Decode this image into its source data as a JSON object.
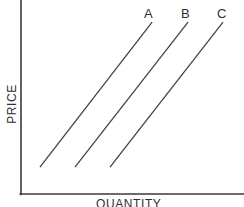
{
  "figure": {
    "name": "supply-curve-shift-diagram",
    "background_color": "#ffffff",
    "width": 244,
    "height": 207
  },
  "axes": {
    "y_axis_label": "PRICE",
    "x_axis_label": "QUANTITY",
    "axis_color": "#3a3a3f"
  },
  "labels": {
    "a": "A",
    "b": "B",
    "c": "C"
  },
  "chart_data": {
    "type": "line",
    "title": "",
    "subtitle": "",
    "xlabel": "QUANTITY",
    "ylabel": "PRICE",
    "xlim": [
      0,
      100
    ],
    "ylim": [
      0,
      100
    ],
    "grid": false,
    "legend": "inline-end-labels",
    "axis_ticks": [],
    "annotations": [
      "A",
      "B",
      "C"
    ],
    "line_color": "#3f3f45",
    "series": [
      {
        "name": "A",
        "label": "A",
        "x": [
          8.5,
          58.8
        ],
        "y": [
          13.9,
          88.6
        ],
        "color": "#3f3f45"
      },
      {
        "name": "B",
        "label": "B",
        "x": [
          24.2,
          74.9
        ],
        "y": [
          13.9,
          88.6
        ],
        "color": "#3f3f45"
      },
      {
        "name": "C",
        "label": "C",
        "x": [
          39.9,
          90.6
        ],
        "y": [
          13.9,
          88.6
        ],
        "color": "#3f3f45"
      }
    ]
  }
}
